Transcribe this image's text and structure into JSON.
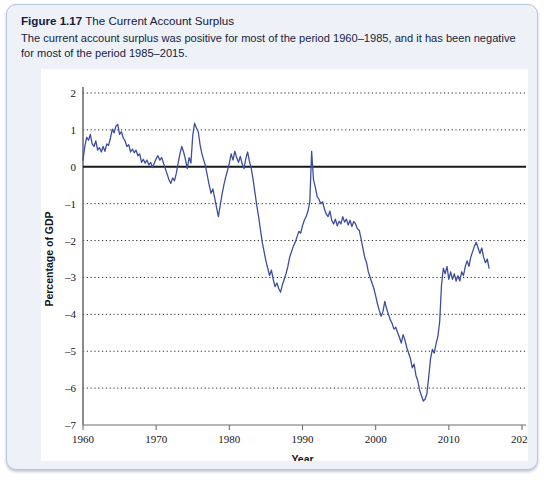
{
  "figure": {
    "label": "Figure 1.17",
    "title": "The Current Account Surplus",
    "caption": "The current account surplus was positive for most of the period 1960–1985, and it has been negative for most of the period 1985–2015."
  },
  "colors": {
    "line": "#3b4f9e",
    "zero_line": "#1a1a1a",
    "grid": "#2a2a2a",
    "axis": "#6f6f76",
    "panel_background": "#ffffff",
    "card_background": "#eef1f8",
    "card_border": "#b9c4dd"
  },
  "chart_data": {
    "type": "line",
    "title": "The Current Account Surplus",
    "xlabel": "Year",
    "ylabel": "Percentage of GDP",
    "xlim": [
      1960,
      2020
    ],
    "ylim": [
      -7,
      2
    ],
    "xticks": [
      1960,
      1970,
      1980,
      1990,
      2000,
      2010,
      2020
    ],
    "yticks": [
      2,
      1,
      0,
      -1,
      -2,
      -3,
      -4,
      -5,
      -6,
      -7
    ],
    "xtick_labels": [
      "1960",
      "1970",
      "1980",
      "1990",
      "2000",
      "2010",
      "2020"
    ],
    "ytick_labels": [
      "2",
      "1",
      "0",
      "–1",
      "–2",
      "–3",
      "–4",
      "–5",
      "–6",
      "–7"
    ],
    "grid": "horizontal-dotted",
    "legend": "none",
    "zero_reference_line": 0,
    "series": [
      {
        "name": "Current account surplus",
        "color": "#3b4f9e",
        "x": [
          1960.0,
          1960.25,
          1960.5,
          1960.75,
          1961.0,
          1961.25,
          1961.5,
          1961.75,
          1962.0,
          1962.25,
          1962.5,
          1962.75,
          1963.0,
          1963.25,
          1963.5,
          1963.75,
          1964.0,
          1964.25,
          1964.5,
          1964.75,
          1965.0,
          1965.25,
          1965.5,
          1965.75,
          1966.0,
          1966.25,
          1966.5,
          1966.75,
          1967.0,
          1967.25,
          1967.5,
          1967.75,
          1968.0,
          1968.25,
          1968.5,
          1968.75,
          1969.0,
          1969.25,
          1969.5,
          1969.75,
          1970.0,
          1970.25,
          1970.5,
          1970.75,
          1971.0,
          1971.25,
          1971.5,
          1971.75,
          1972.0,
          1972.25,
          1972.5,
          1972.75,
          1973.0,
          1973.25,
          1973.5,
          1973.75,
          1974.0,
          1974.25,
          1974.5,
          1974.75,
          1975.0,
          1975.25,
          1975.5,
          1975.75,
          1976.0,
          1976.25,
          1976.5,
          1976.75,
          1977.0,
          1977.25,
          1977.5,
          1977.75,
          1978.0,
          1978.25,
          1978.5,
          1978.75,
          1979.0,
          1979.25,
          1979.5,
          1979.75,
          1980.0,
          1980.25,
          1980.5,
          1980.75,
          1981.0,
          1981.25,
          1981.5,
          1981.75,
          1982.0,
          1982.25,
          1982.5,
          1982.75,
          1983.0,
          1983.25,
          1983.5,
          1983.75,
          1984.0,
          1984.25,
          1984.5,
          1984.75,
          1985.0,
          1985.25,
          1985.5,
          1985.75,
          1986.0,
          1986.25,
          1986.5,
          1986.75,
          1987.0,
          1987.25,
          1987.5,
          1987.75,
          1988.0,
          1988.25,
          1988.5,
          1988.75,
          1989.0,
          1989.25,
          1989.5,
          1989.75,
          1990.0,
          1990.25,
          1990.5,
          1990.75,
          1991.0,
          1991.25,
          1991.5,
          1991.75,
          1992.0,
          1992.25,
          1992.5,
          1992.75,
          1993.0,
          1993.25,
          1993.5,
          1993.75,
          1994.0,
          1994.25,
          1994.5,
          1994.75,
          1995.0,
          1995.25,
          1995.5,
          1995.75,
          1996.0,
          1996.25,
          1996.5,
          1996.75,
          1997.0,
          1997.25,
          1997.5,
          1997.75,
          1998.0,
          1998.25,
          1998.5,
          1998.75,
          1999.0,
          1999.25,
          1999.5,
          1999.75,
          2000.0,
          2000.25,
          2000.5,
          2000.75,
          2001.0,
          2001.25,
          2001.5,
          2001.75,
          2002.0,
          2002.25,
          2002.5,
          2002.75,
          2003.0,
          2003.25,
          2003.5,
          2003.75,
          2004.0,
          2004.25,
          2004.5,
          2004.75,
          2005.0,
          2005.25,
          2005.5,
          2005.75,
          2006.0,
          2006.25,
          2006.5,
          2006.75,
          2007.0,
          2007.25,
          2007.5,
          2007.75,
          2008.0,
          2008.25,
          2008.5,
          2008.75,
          2009.0,
          2009.25,
          2009.5,
          2009.75,
          2010.0,
          2010.25,
          2010.5,
          2010.75,
          2011.0,
          2011.25,
          2011.5,
          2011.75,
          2012.0,
          2012.25,
          2012.5,
          2012.75,
          2013.0,
          2013.25,
          2013.5,
          2013.75,
          2014.0,
          2014.25,
          2014.5,
          2014.75,
          2015.0,
          2015.25,
          2015.5
        ],
        "y": [
          0.18,
          0.55,
          0.8,
          0.72,
          0.88,
          0.62,
          0.55,
          0.7,
          0.45,
          0.52,
          0.4,
          0.55,
          0.42,
          0.62,
          0.58,
          0.78,
          1.02,
          0.92,
          1.1,
          1.15,
          0.88,
          0.95,
          0.78,
          0.7,
          0.55,
          0.6,
          0.4,
          0.48,
          0.38,
          0.45,
          0.3,
          0.35,
          0.12,
          0.2,
          0.1,
          0.18,
          0.05,
          0.12,
          -0.02,
          0.1,
          0.22,
          0.3,
          0.18,
          0.25,
          0.1,
          -0.05,
          -0.2,
          -0.35,
          -0.45,
          -0.3,
          -0.38,
          -0.18,
          0.1,
          0.35,
          0.55,
          0.4,
          0.2,
          -0.05,
          0.25,
          0.1,
          0.85,
          1.18,
          1.05,
          0.95,
          0.6,
          0.35,
          0.18,
          0.02,
          -0.25,
          -0.5,
          -0.72,
          -0.6,
          -0.85,
          -1.1,
          -1.35,
          -1.05,
          -0.75,
          -0.5,
          -0.28,
          -0.1,
          0.1,
          0.35,
          0.18,
          0.42,
          0.25,
          0.12,
          0.28,
          0.08,
          -0.05,
          0.22,
          0.4,
          0.15,
          -0.05,
          -0.35,
          -0.7,
          -1.05,
          -1.35,
          -1.7,
          -2.05,
          -2.3,
          -2.55,
          -2.75,
          -2.95,
          -2.8,
          -3.05,
          -3.25,
          -3.15,
          -3.3,
          -3.4,
          -3.2,
          -3.05,
          -2.9,
          -2.7,
          -2.45,
          -2.3,
          -2.15,
          -2.05,
          -1.9,
          -1.75,
          -1.8,
          -1.6,
          -1.45,
          -1.35,
          -1.2,
          -0.95,
          0.42,
          -0.35,
          -0.55,
          -0.8,
          -0.88,
          -1.0,
          -0.95,
          -1.15,
          -1.28,
          -1.35,
          -1.2,
          -1.45,
          -1.55,
          -1.42,
          -1.6,
          -1.48,
          -1.55,
          -1.35,
          -1.5,
          -1.42,
          -1.58,
          -1.45,
          -1.62,
          -1.48,
          -1.55,
          -1.68,
          -1.72,
          -1.95,
          -2.2,
          -2.45,
          -2.6,
          -2.85,
          -3.0,
          -3.15,
          -3.3,
          -3.5,
          -3.72,
          -3.9,
          -4.05,
          -3.92,
          -3.65,
          -3.85,
          -4.0,
          -4.15,
          -4.25,
          -4.4,
          -4.35,
          -4.5,
          -4.62,
          -4.78,
          -4.55,
          -4.7,
          -4.9,
          -5.05,
          -5.2,
          -5.45,
          -5.35,
          -5.65,
          -5.8,
          -6.05,
          -6.2,
          -6.35,
          -6.3,
          -6.15,
          -5.7,
          -5.2,
          -4.95,
          -5.05,
          -4.8,
          -4.6,
          -4.2,
          -3.2,
          -2.75,
          -2.9,
          -2.7,
          -3.05,
          -2.85,
          -3.05,
          -2.9,
          -3.1,
          -2.95,
          -3.1,
          -2.85,
          -2.95,
          -2.7,
          -2.55,
          -2.7,
          -2.45,
          -2.3,
          -2.15,
          -2.05,
          -2.2,
          -2.35,
          -2.2,
          -2.45,
          -2.6,
          -2.5,
          -2.75
        ]
      }
    ]
  }
}
